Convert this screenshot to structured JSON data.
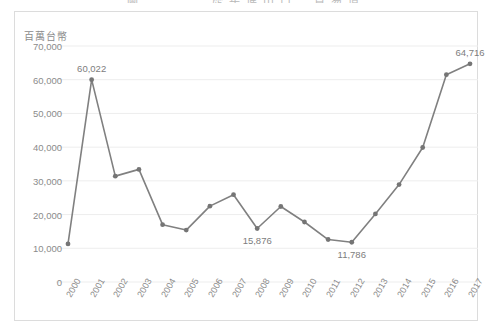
{
  "figure": {
    "title": "圖一　　　歷年進出口　貿易值"
  },
  "chart_data": {
    "type": "line",
    "title": "圖一　　　歷年進出口　貿易值",
    "xlabel": "",
    "ylabel": "百萬台幣",
    "unit_label": "百萬台幣",
    "grid": true,
    "legend": "none",
    "marker": "circle",
    "line_color": "#808080",
    "marker_color": "#757575",
    "grid_color": "#ededed",
    "text_color": "#8b8b8b",
    "ylim": [
      0,
      70000
    ],
    "yticks": [
      0,
      10000,
      20000,
      30000,
      40000,
      50000,
      60000,
      70000
    ],
    "ytick_labels": [
      "0",
      "10,000",
      "20,000",
      "30,000",
      "40,000",
      "50,000",
      "60,000",
      "70,000"
    ],
    "categories": [
      "2000",
      "2001",
      "2002",
      "2003",
      "2004",
      "2005",
      "2006",
      "2007",
      "2008",
      "2009",
      "2010",
      "2011",
      "2012",
      "2013",
      "2014",
      "2015",
      "2016",
      "2017"
    ],
    "values": [
      11300,
      60022,
      31400,
      33400,
      17000,
      15400,
      22500,
      25900,
      15876,
      22400,
      17800,
      12600,
      11786,
      20200,
      28900,
      39900,
      61500,
      64716
    ],
    "point_labels": [
      {
        "category": "2001",
        "value": 60022,
        "text": "60,022"
      },
      {
        "category": "2008",
        "value": 15876,
        "text": "15,876"
      },
      {
        "category": "2012",
        "value": 11786,
        "text": "11,786"
      },
      {
        "category": "2017",
        "value": 64716,
        "text": "64,716"
      }
    ]
  }
}
